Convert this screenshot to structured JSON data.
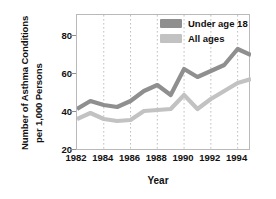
{
  "chart_data": {
    "type": "line",
    "title": "",
    "xlabel": "Year",
    "ylabel_line1": "Number of Asthma Conditions",
    "ylabel_line2": "per 1,000 Persons",
    "x": [
      1982,
      1983,
      1984,
      1985,
      1986,
      1987,
      1988,
      1989,
      1990,
      1991,
      1992,
      1993,
      1994,
      1995
    ],
    "xlim": [
      1982,
      1995
    ],
    "ylim": [
      20,
      88
    ],
    "yticks": [
      20,
      40,
      60,
      80
    ],
    "xticks": [
      1982,
      1984,
      1986,
      1988,
      1990,
      1992,
      1994
    ],
    "grid": "vertical-dotted",
    "legend_position": "top-right",
    "series": [
      {
        "name": "Under age 18",
        "color": "#8f8f8f",
        "values": [
          41,
          45,
          43,
          42,
          45,
          50,
          53,
          48,
          61,
          57,
          60,
          63,
          71,
          68
        ]
      },
      {
        "name": "All ages",
        "color": "#c2c2c2",
        "values": [
          36,
          39,
          36,
          35,
          35.5,
          40,
          40.5,
          41,
          48,
          41,
          46,
          50,
          54,
          56
        ]
      }
    ]
  },
  "legend": {
    "items": [
      {
        "label": "Under age 18",
        "color": "#8f8f8f"
      },
      {
        "label": "All ages",
        "color": "#c2c2c2"
      }
    ]
  },
  "axes": {
    "y_title_line1": "Number of Asthma Conditions",
    "y_title_line2": "per 1,000 Persons",
    "x_title": "Year",
    "y_tick_labels": [
      "80",
      "60",
      "40",
      "20"
    ],
    "x_tick_labels": [
      "1982",
      "1984",
      "1986",
      "1988",
      "1990",
      "1992",
      "1994"
    ]
  },
  "colors": {
    "series_dark": "#8f8f8f",
    "series_light": "#c2c2c2",
    "frame": "#b9b9b9",
    "gridline": "#b0b0b0",
    "text": "#111111",
    "background": "#ffffff"
  }
}
